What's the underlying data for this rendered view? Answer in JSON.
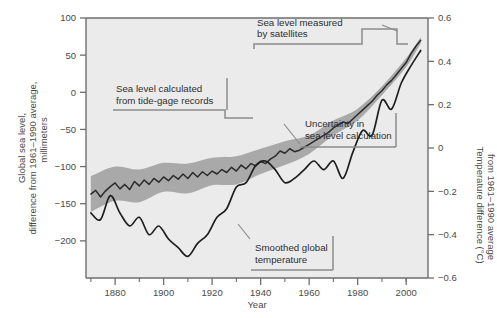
{
  "axes": {
    "x": {
      "label": "Year",
      "ticks": [
        1880,
        1900,
        1920,
        1940,
        1960,
        1980,
        2000
      ],
      "tick_labels": [
        "1880",
        "1900",
        "1920",
        "1940",
        "1960",
        "1980",
        "2000"
      ],
      "minor_ticks": [
        1870,
        1890,
        1910,
        1930,
        1950,
        1970,
        1990,
        2000
      ],
      "range": [
        1868,
        2009
      ]
    },
    "y_left": {
      "label_line1": "Global sea level,",
      "label_line2": "difference from 1961–1990 average,",
      "label_line3": "millimeters",
      "ticks": [
        100,
        50,
        0,
        -50,
        -100,
        -150,
        -200
      ],
      "tick_labels": [
        "100",
        "50",
        "0",
        "−50",
        "−100",
        "−150",
        "−200"
      ],
      "range": [
        -250,
        100
      ]
    },
    "y_right": {
      "label_line1": "Temperature difference (°C)",
      "label_line2": "from 1961–1990 average",
      "ticks": [
        0.6,
        0.4,
        0.2,
        0,
        -0.2,
        -0.4,
        -0.6
      ],
      "tick_labels": [
        "0.6",
        "0.4",
        "0.2",
        "0",
        "−0.2",
        "−0.4",
        "−0.6"
      ],
      "range": [
        -0.6,
        0.6
      ]
    }
  },
  "callouts": {
    "satellites": {
      "line1": "Sea level measured",
      "line2": "by satellites"
    },
    "tide_gage": {
      "line1": "Sea level calculated",
      "line2": "from tide-gage records"
    },
    "uncertainty": {
      "line1": "Uncertainty in",
      "line2": "sea level calculation"
    },
    "temperature": {
      "line1": "Smoothed global",
      "line2": "temperature"
    }
  },
  "colors": {
    "plot_background": "#ebebeb",
    "uncertainty_band": "#a9a9a9",
    "sea_level_line": "#2b2b2b",
    "temperature_line": "#1f1f1f",
    "axis": "#6e6e6e",
    "callout_rule": "#8c8c8c",
    "text": "#3f3f3f"
  },
  "chart_data": {
    "type": "line",
    "title": "",
    "xlabel": "Year",
    "ylabel": "Global sea level, difference from 1961-1990 average, millimeters",
    "ylabel_right": "Temperature difference (°C) from 1961-1990 average",
    "xlim": [
      1868,
      2009
    ],
    "ylim": [
      -250,
      100
    ],
    "ylim_right": [
      -0.6,
      0.6
    ],
    "grid": false,
    "legend": "none (inline annotations)",
    "series": [
      {
        "name": "Global sea level (tide-gage + satellite)",
        "axis": "left",
        "units": "mm",
        "x": [
          1870,
          1872,
          1874,
          1876,
          1878,
          1880,
          1882,
          1884,
          1886,
          1888,
          1890,
          1892,
          1894,
          1896,
          1898,
          1900,
          1902,
          1904,
          1906,
          1908,
          1910,
          1912,
          1914,
          1916,
          1918,
          1920,
          1922,
          1924,
          1926,
          1928,
          1930,
          1932,
          1934,
          1936,
          1938,
          1940,
          1942,
          1944,
          1946,
          1948,
          1950,
          1952,
          1954,
          1956,
          1958,
          1960,
          1962,
          1964,
          1966,
          1968,
          1970,
          1972,
          1974,
          1976,
          1978,
          1980,
          1982,
          1984,
          1986,
          1988,
          1990,
          1992,
          1994,
          1996,
          1998,
          2000,
          2002,
          2004,
          2006
        ],
        "values": [
          -137,
          -132,
          -141,
          -133,
          -127,
          -122,
          -130,
          -124,
          -131,
          -120,
          -126,
          -118,
          -124,
          -116,
          -121,
          -114,
          -119,
          -112,
          -117,
          -110,
          -116,
          -108,
          -114,
          -107,
          -112,
          -106,
          -110,
          -104,
          -108,
          -101,
          -106,
          -98,
          -103,
          -96,
          -99,
          -93,
          -96,
          -90,
          -86,
          -79,
          -82,
          -76,
          -80,
          -78,
          -74,
          -70,
          -66,
          -62,
          -58,
          -54,
          -48,
          -44,
          -40,
          -42,
          -36,
          -30,
          -24,
          -18,
          -12,
          -4,
          2,
          10,
          16,
          24,
          32,
          40,
          52,
          62,
          70
        ]
      },
      {
        "name": "Sea level uncertainty upper bound",
        "axis": "left",
        "units": "mm",
        "x": [
          1870,
          1880,
          1890,
          1900,
          1910,
          1920,
          1930,
          1940,
          1950,
          1960,
          1970,
          1980,
          1990,
          2000,
          2006
        ],
        "values": [
          -113,
          -100,
          -104,
          -95,
          -96,
          -88,
          -86,
          -76,
          -66,
          -58,
          -38,
          -22,
          8,
          46,
          74
        ]
      },
      {
        "name": "Sea level uncertainty lower bound",
        "axis": "left",
        "units": "mm",
        "x": [
          1870,
          1880,
          1890,
          1900,
          1910,
          1920,
          1930,
          1940,
          1950,
          1960,
          1970,
          1980,
          1990,
          2000,
          2006
        ],
        "values": [
          -161,
          -146,
          -148,
          -134,
          -136,
          -125,
          -124,
          -110,
          -98,
          -83,
          -58,
          -38,
          -4,
          34,
          66
        ]
      },
      {
        "name": "Smoothed global temperature",
        "axis": "right",
        "units": "°C",
        "x": [
          1870,
          1874,
          1878,
          1882,
          1886,
          1890,
          1894,
          1898,
          1902,
          1906,
          1910,
          1914,
          1918,
          1922,
          1926,
          1930,
          1934,
          1938,
          1942,
          1946,
          1950,
          1954,
          1958,
          1962,
          1966,
          1970,
          1974,
          1978,
          1982,
          1986,
          1990,
          1994,
          1998,
          2002,
          2006
        ],
        "values": [
          -0.3,
          -0.33,
          -0.22,
          -0.3,
          -0.36,
          -0.32,
          -0.4,
          -0.36,
          -0.42,
          -0.46,
          -0.5,
          -0.44,
          -0.4,
          -0.32,
          -0.28,
          -0.18,
          -0.16,
          -0.08,
          -0.06,
          -0.1,
          -0.16,
          -0.14,
          -0.1,
          -0.06,
          -0.1,
          -0.06,
          -0.14,
          -0.02,
          0.08,
          0.06,
          0.22,
          0.18,
          0.3,
          0.38,
          0.45
        ]
      }
    ],
    "annotations": [
      {
        "text": "Sea level measured by satellites",
        "points_to": "sea-level curve, ~1995-2006"
      },
      {
        "text": "Sea level calculated from tide-gage records",
        "points_to": "sea-level curve, ~1870-1990"
      },
      {
        "text": "Uncertainty in sea level calculation",
        "points_to": "shaded band around sea-level curve"
      },
      {
        "text": "Smoothed global temperature",
        "points_to": "temperature curve, ~1950"
      }
    ]
  }
}
